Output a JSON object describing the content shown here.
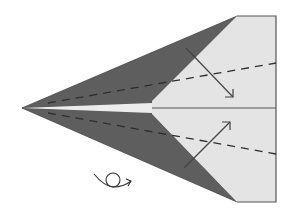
{
  "diagram": {
    "colors": {
      "background": "#ffffff",
      "dark_face": "#5e5e5e",
      "light_face": "#e4e4e4",
      "center_strip": "#ececec",
      "outline": "#555555",
      "dash": "#3a3a3a",
      "arrow": "#444444"
    },
    "elements": [
      {
        "name": "dark-upper-wing",
        "kind": "polygon",
        "points": "22,108 237,16 152,101 152,104 60,106"
      },
      {
        "name": "dark-lower-wing",
        "kind": "polygon",
        "points": "22,108 60,110 152,112 152,114 237,202"
      },
      {
        "name": "light-upper-flap",
        "kind": "polygon",
        "points": "237,16 276,16 276,108 152,108 152,101"
      },
      {
        "name": "light-lower-flap",
        "kind": "polygon",
        "points": "152,108 276,108 276,202 237,202 152,114"
      },
      {
        "name": "center-strip",
        "kind": "polygon",
        "points": "22,108 152,103 152,113"
      }
    ],
    "fold_lines": [
      {
        "name": "upper-valley-fold",
        "type": "dashed",
        "from": [
          48,
          103
        ],
        "to": [
          276,
          63
        ]
      },
      {
        "name": "lower-valley-fold",
        "type": "dashed",
        "from": [
          48,
          113
        ],
        "to": [
          276,
          154
        ]
      }
    ],
    "arrows": [
      {
        "name": "fold-down-arrow",
        "from": [
          186,
          48
        ],
        "to": [
          233,
          97
        ]
      },
      {
        "name": "fold-up-arrow",
        "from": [
          184,
          168
        ],
        "to": [
          230,
          122
        ]
      }
    ],
    "symbols": [
      {
        "name": "turn-over-symbol",
        "meaning": "turn over",
        "center": [
          113,
          180
        ]
      }
    ]
  }
}
